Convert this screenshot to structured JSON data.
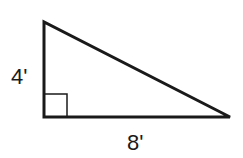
{
  "diagram": {
    "type": "right-triangle",
    "vertices": {
      "top": [
        44,
        22
      ],
      "right_angle": [
        44,
        117
      ],
      "bottom_right": [
        230,
        117
      ]
    },
    "right_angle_marker": {
      "x": 44,
      "y": 94,
      "size": 23
    },
    "labels": {
      "height": "4'",
      "base": "8'"
    },
    "colors": {
      "stroke": "#1a1a1a",
      "background": "#ffffff"
    }
  }
}
